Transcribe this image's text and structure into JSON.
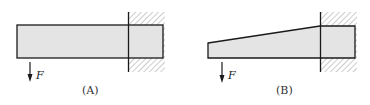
{
  "figures": [
    {
      "id": "A",
      "caption": "(A)",
      "beam_shape": "rectangular",
      "load_label": "F",
      "load_direction": "down",
      "support": "fixed-wall-right"
    },
    {
      "id": "B",
      "caption": "(B)",
      "beam_shape": "tapered",
      "load_label": "F",
      "load_direction": "down",
      "support": "fixed-wall-right"
    }
  ],
  "colors": {
    "beam_fill": "#e4e4e4",
    "stroke": "#1a1a1a",
    "hatch": "#9a9a9a"
  }
}
